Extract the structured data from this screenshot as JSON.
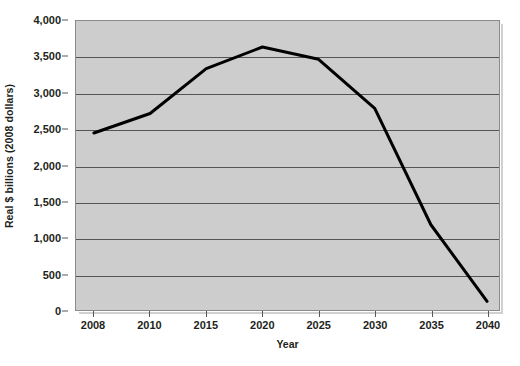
{
  "figure": {
    "top_clipped_caption": "",
    "background_color": "#ffffff",
    "plot_background_color": "#cdcdcd",
    "gridline_color": "#555558",
    "line_color": "#000000",
    "axis_color": "#58585b"
  },
  "chart_data": {
    "type": "line",
    "title": "",
    "xlabel": "Year",
    "ylabel": "Real $ billions (2008 dollars)",
    "categories": [
      "2008",
      "2010",
      "2015",
      "2020",
      "2025",
      "2030",
      "2035",
      "2040"
    ],
    "values": [
      2450,
      2720,
      3340,
      3640,
      3470,
      2790,
      1180,
      120
    ],
    "series": [
      {
        "name": "Real $ billions (2008 dollars)",
        "values": [
          2450,
          2720,
          3340,
          3640,
          3470,
          2790,
          1180,
          120
        ]
      }
    ],
    "ylim": [
      0,
      4000
    ],
    "ytick_values": [
      0,
      500,
      1000,
      1500,
      2000,
      2500,
      3000,
      3500,
      4000
    ],
    "ytick_labels": [
      "0",
      "500",
      "1,000",
      "1,500",
      "2,000",
      "2,500",
      "3,000",
      "3,500",
      "4,000"
    ],
    "grid": true,
    "grid_axis": "y",
    "legend": false,
    "legend_position": "none",
    "line_width": 3,
    "markers": false
  }
}
